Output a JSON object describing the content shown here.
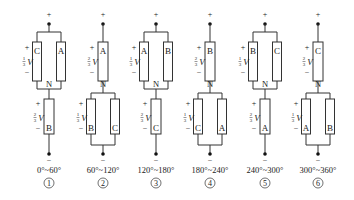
{
  "diagram": {
    "colors": {
      "line": "#333333",
      "background": "#ffffff",
      "text": "#222222"
    },
    "voltage_symbol": "V",
    "neutral_label": "N",
    "plus_sign": "+",
    "minus_sign": "−",
    "panels": [
      {
        "index": 1,
        "circled_number": "①",
        "range_label": "0°~60°",
        "top_group": {
          "type": "parallel",
          "resistors": [
            "C",
            "A"
          ],
          "voltage_fraction": "1/3"
        },
        "bottom_group": {
          "type": "single",
          "resistors": [
            "B"
          ],
          "voltage_fraction": "2/3"
        }
      },
      {
        "index": 2,
        "circled_number": "②",
        "range_label": "60°~120°",
        "top_group": {
          "type": "single",
          "resistors": [
            "A"
          ],
          "voltage_fraction": "2/3"
        },
        "bottom_group": {
          "type": "parallel",
          "resistors": [
            "B",
            "C"
          ],
          "voltage_fraction": "1/3"
        }
      },
      {
        "index": 3,
        "circled_number": "③",
        "range_label": "120°~180°",
        "top_group": {
          "type": "parallel",
          "resistors": [
            "A",
            "B"
          ],
          "voltage_fraction": "1/3"
        },
        "bottom_group": {
          "type": "single",
          "resistors": [
            "C"
          ],
          "voltage_fraction": "2/3"
        }
      },
      {
        "index": 4,
        "circled_number": "④",
        "range_label": "180°~240°",
        "top_group": {
          "type": "single",
          "resistors": [
            "B"
          ],
          "voltage_fraction": "2/3"
        },
        "bottom_group": {
          "type": "parallel",
          "resistors": [
            "C",
            "A"
          ],
          "voltage_fraction": "1/3"
        }
      },
      {
        "index": 5,
        "circled_number": "⑤",
        "range_label": "240°~300°",
        "top_group": {
          "type": "parallel",
          "resistors": [
            "B",
            "C"
          ],
          "voltage_fraction": "1/3"
        },
        "bottom_group": {
          "type": "single",
          "resistors": [
            "A"
          ],
          "voltage_fraction": "2/3"
        }
      },
      {
        "index": 6,
        "circled_number": "⑥",
        "range_label": "300°~360°",
        "top_group": {
          "type": "single",
          "resistors": [
            "C"
          ],
          "voltage_fraction": "2/3"
        },
        "bottom_group": {
          "type": "parallel",
          "resistors": [
            "A",
            "B"
          ],
          "voltage_fraction": "1/3"
        }
      }
    ]
  }
}
